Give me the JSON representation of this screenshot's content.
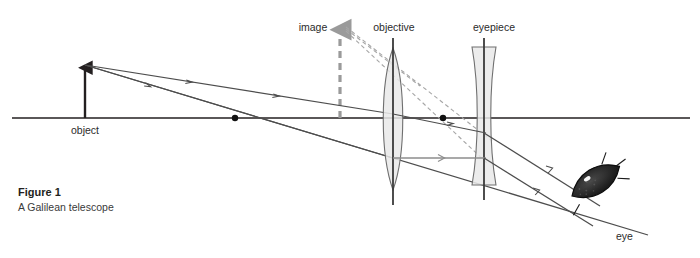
{
  "figure": {
    "caption_title": "Figure 1",
    "caption_subtitle": "A Galilean telescope",
    "background_color": "#ffffff",
    "ink_color": "#231f20",
    "ray_color": "#4d4d4d",
    "gray_ray_color": "#8c8c8c",
    "lens_fill": "#e9e9e9",
    "lens_stroke": "#6f6f6f",
    "page_bleed_text": "a page header line clipped at the top edge"
  },
  "labels": {
    "object": "object",
    "image": "image",
    "objective": "objective",
    "eyepiece": "eyepiece",
    "eye": "eye"
  },
  "diagram_data": {
    "type": "optical-ray-diagram",
    "subject": "Galilean telescope",
    "optical_axis": {
      "y": 118,
      "x_start": 12,
      "x_end": 690
    },
    "elements": [
      {
        "name": "object",
        "kind": "arrow-solid",
        "x": 85,
        "y_base": 118,
        "y_tip": 65,
        "color": "#231f20",
        "direction": "up"
      },
      {
        "name": "image",
        "kind": "arrow-dashed",
        "x": 340,
        "y_base": 118,
        "y_tip": 25,
        "color": "#9a9a9a",
        "direction": "up"
      },
      {
        "name": "objective",
        "kind": "biconvex-lens",
        "x": 393,
        "y_top": 48,
        "y_bottom": 190,
        "half_width": 13
      },
      {
        "name": "eyepiece",
        "kind": "biconcave-lens",
        "x": 484,
        "y_top": 47,
        "y_bottom": 185,
        "half_width": 12
      },
      {
        "name": "eye",
        "kind": "eye-glyph",
        "x": 600,
        "y": 215,
        "rotation_deg": -28
      }
    ],
    "focal_points": [
      {
        "label": "",
        "x": 235,
        "y": 118
      },
      {
        "label": "",
        "x": 443,
        "y": 118
      }
    ],
    "rays": [
      {
        "id": "ray-upper-object-to-objective",
        "style": "solid",
        "color": "#4d4d4d",
        "points": [
          [
            85,
            65
          ],
          [
            393,
            114
          ]
        ],
        "arrow_at": 0.55
      },
      {
        "id": "ray-lower-object-to-objective",
        "style": "solid",
        "color": "#4d4d4d",
        "points": [
          [
            85,
            65
          ],
          [
            393,
            158
          ]
        ],
        "arrow_at": 0.42
      },
      {
        "id": "ray-axis-crossing",
        "style": "solid",
        "color": "#4d4d4d",
        "points": [
          [
            85,
            65
          ],
          [
            640,
            232
          ]
        ]
      },
      {
        "id": "ray-objective-to-eyepiece-upper",
        "style": "solid",
        "color": "#4d4d4d",
        "points": [
          [
            393,
            114
          ],
          [
            484,
            133
          ]
        ],
        "arrow_at": 0.6
      },
      {
        "id": "ray-objective-to-eyepiece-lower",
        "style": "solid",
        "color": "#8c8c8c",
        "points": [
          [
            393,
            158
          ],
          [
            484,
            158
          ]
        ],
        "arrow_at": 0.55
      },
      {
        "id": "ray-exit-upper",
        "style": "solid",
        "color": "#4d4d4d",
        "points": [
          [
            484,
            133
          ],
          [
            598,
            205
          ]
        ],
        "arrow_at": 0.65
      },
      {
        "id": "ray-exit-lower",
        "style": "solid",
        "color": "#4d4d4d",
        "points": [
          [
            484,
            158
          ],
          [
            592,
            225
          ]
        ],
        "arrow_at": 0.62
      },
      {
        "id": "construction-upper",
        "style": "dashed",
        "color": "#a6a6a6",
        "points": [
          [
            345,
            26
          ],
          [
            489,
            139
          ]
        ]
      },
      {
        "id": "construction-lower",
        "style": "dashed",
        "color": "#a6a6a6",
        "points": [
          [
            345,
            30
          ],
          [
            486,
            160
          ]
        ]
      }
    ]
  }
}
